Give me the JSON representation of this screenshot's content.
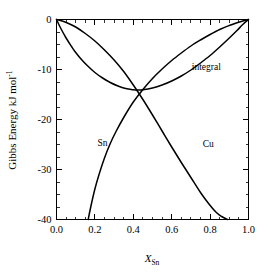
{
  "chart_data": {
    "type": "line",
    "title": "",
    "xlabel": "X_Sn",
    "xlabel_base": "X",
    "xlabel_sub": "Sn",
    "ylabel": "Gibbs Energy kJ mol-1",
    "ylabel_base": "Gibbs Energy kJ mol",
    "ylabel_sup": "-1",
    "xlim": [
      0.0,
      1.0
    ],
    "ylim": [
      -40,
      0
    ],
    "xticks": [
      0.0,
      0.2,
      0.4,
      0.6,
      0.8,
      1.0
    ],
    "xtick_labels": [
      "0.0",
      "0.2",
      "0.4",
      "0.6",
      "0.8",
      "1.0"
    ],
    "yticks": [
      0,
      -10,
      -20,
      -30,
      -40
    ],
    "ytick_labels": [
      "0",
      "-10",
      "-20",
      "-30",
      "-40"
    ],
    "x_minor_step": 0.05,
    "y_minor_step": 2.5,
    "grid": false,
    "legend_position": "inline-annotations",
    "frame": "box",
    "tick_direction": "in",
    "line_color": "#000000",
    "background_color": "#ffffff",
    "annotations": [
      {
        "text": "integral",
        "x": 0.78,
        "y": -10.0
      },
      {
        "text": "Sn",
        "x": 0.24,
        "y": -25.2
      },
      {
        "text": "Cu",
        "x": 0.79,
        "y": -25.5
      }
    ],
    "series": [
      {
        "name": "integral",
        "label": "integral",
        "x": [
          0.0,
          0.02,
          0.05,
          0.08,
          0.1,
          0.13,
          0.16,
          0.2,
          0.24,
          0.28,
          0.32,
          0.36,
          0.4,
          0.42,
          0.45,
          0.5,
          0.55,
          0.6,
          0.65,
          0.7,
          0.75,
          0.8,
          0.85,
          0.9,
          0.94,
          0.97,
          1.0
        ],
        "y": [
          0.0,
          -1.6,
          -3.7,
          -5.5,
          -6.6,
          -8.0,
          -9.2,
          -10.6,
          -11.7,
          -12.6,
          -13.3,
          -13.8,
          -14.05,
          -14.1,
          -14.05,
          -13.7,
          -13.1,
          -12.3,
          -11.3,
          -10.1,
          -8.7,
          -7.2,
          -5.5,
          -3.7,
          -2.2,
          -1.0,
          0.0
        ]
      },
      {
        "name": "Sn",
        "label": "Sn",
        "x": [
          0.165,
          0.18,
          0.2,
          0.22,
          0.25,
          0.28,
          0.31,
          0.35,
          0.4,
          0.45,
          0.5,
          0.55,
          0.6,
          0.65,
          0.7,
          0.75,
          0.8,
          0.85,
          0.9,
          0.94,
          0.97,
          1.0
        ],
        "y": [
          -40.0,
          -37.2,
          -33.9,
          -31.2,
          -27.7,
          -24.8,
          -22.4,
          -19.6,
          -16.5,
          -14.0,
          -11.8,
          -9.9,
          -8.2,
          -6.7,
          -5.3,
          -4.1,
          -3.0,
          -2.0,
          -1.2,
          -0.65,
          -0.3,
          0.0
        ]
      },
      {
        "name": "Cu",
        "label": "Cu",
        "x": [
          0.0,
          0.03,
          0.06,
          0.1,
          0.15,
          0.2,
          0.25,
          0.3,
          0.35,
          0.4,
          0.45,
          0.5,
          0.55,
          0.6,
          0.65,
          0.7,
          0.75,
          0.79,
          0.83,
          0.86,
          0.89
        ],
        "y": [
          0.0,
          -0.3,
          -0.75,
          -1.5,
          -2.8,
          -4.3,
          -6.1,
          -8.1,
          -10.4,
          -13.1,
          -16.0,
          -19.1,
          -22.3,
          -25.5,
          -28.6,
          -31.6,
          -34.6,
          -36.7,
          -38.5,
          -39.4,
          -40.0
        ]
      }
    ]
  }
}
